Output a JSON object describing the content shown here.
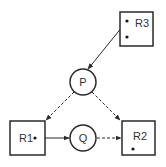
{
  "diagram": {
    "type": "resource-allocation-graph",
    "colors": {
      "stroke": "#2a2a2a",
      "text": "#333333",
      "background": "#ffffff"
    },
    "processes": [
      {
        "id": "P",
        "label": "P",
        "cx": 83,
        "cy": 82,
        "r": 13
      },
      {
        "id": "Q",
        "label": "Q",
        "cx": 83,
        "cy": 138,
        "r": 13
      }
    ],
    "resources": [
      {
        "id": "R3",
        "label": "R3",
        "x": 120,
        "y": 12,
        "w": 33,
        "h": 34,
        "instances": 2
      },
      {
        "id": "R1",
        "label": "R1",
        "x": 10,
        "y": 121,
        "w": 35,
        "h": 34,
        "instances": 1
      },
      {
        "id": "R2",
        "label": "R2",
        "x": 122,
        "y": 121,
        "w": 33,
        "h": 34,
        "instances": 1
      }
    ],
    "edges": [
      {
        "from": "R3",
        "to": "P",
        "style": "solid",
        "kind": "assignment"
      },
      {
        "from": "P",
        "to": "R1",
        "style": "dashed",
        "kind": "claim"
      },
      {
        "from": "P",
        "to": "R2",
        "style": "dashed",
        "kind": "claim"
      },
      {
        "from": "R1",
        "to": "Q",
        "style": "solid",
        "kind": "assignment"
      },
      {
        "from": "Q",
        "to": "R2",
        "style": "dashed",
        "kind": "claim"
      }
    ]
  }
}
